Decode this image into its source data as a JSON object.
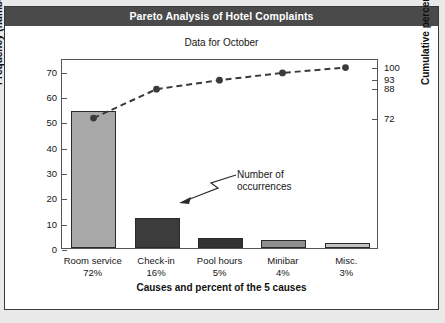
{
  "card": {
    "title": "Pareto Analysis of Hotel Complaints",
    "subtitle": "Data for October"
  },
  "annotation": {
    "line1": "Number of",
    "line2": "occurrences"
  },
  "chart_data": {
    "type": "bar",
    "title": "Pareto Analysis of Hotel Complaints",
    "subtitle": "Data for October",
    "xlabel": "Causes and percent of the 5 causes",
    "ylabel": "Frequency (number)",
    "ylabel_secondary": "Cumulative percent",
    "categories": [
      "Room service",
      "Check-in",
      "Pool hours",
      "Minibar",
      "Misc."
    ],
    "category_percents": [
      "72%",
      "16%",
      "5%",
      "4%",
      "3%"
    ],
    "values": [
      54,
      12,
      4,
      3,
      2
    ],
    "value_labels": [
      "54",
      "12",
      "4",
      "3",
      "2"
    ],
    "bar_colors": [
      "#a8a8a8",
      "#3c3c3c",
      "#333333",
      "#8f8f8f",
      "#c2c2c2"
    ],
    "ylim": [
      0,
      75
    ],
    "yticks": [
      0,
      10,
      20,
      30,
      40,
      50,
      60,
      70
    ],
    "ytick_labels": [
      "0",
      "10",
      "20",
      "30",
      "40",
      "50",
      "60",
      "70"
    ],
    "secondary_ylim": [
      0,
      100
    ],
    "secondary_yticks": [
      72,
      88,
      93,
      100
    ],
    "secondary_ytick_labels": [
      "72",
      "88",
      "93",
      "100"
    ],
    "cumulative_percent": [
      72,
      88,
      93,
      97,
      100
    ],
    "line_style": "dashed",
    "marker": "circle",
    "line_color": "#3a3a3a",
    "grid": false,
    "legend": "none",
    "annotations": [
      {
        "text": "Number of occurrences",
        "points_to": "Check-in bar value 12"
      }
    ]
  }
}
